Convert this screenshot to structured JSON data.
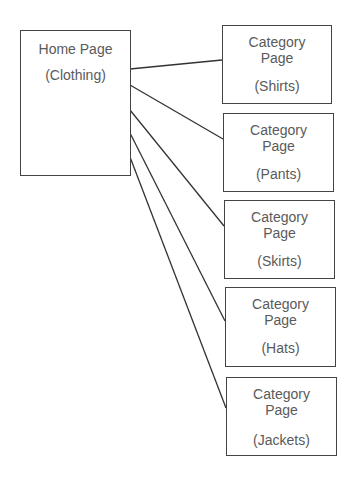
{
  "diagram": {
    "type": "site-hierarchy",
    "root": {
      "title": "Home Page",
      "subtitle": "(Clothing)"
    },
    "children": [
      {
        "title_line1": "Category",
        "title_line2": "Page",
        "subtitle": "(Shirts)"
      },
      {
        "title_line1": "Category",
        "title_line2": "Page",
        "subtitle": "(Pants)"
      },
      {
        "title_line1": "Category",
        "title_line2": "Page",
        "subtitle": "(Skirts)"
      },
      {
        "title_line1": "Category",
        "title_line2": "Page",
        "subtitle": "(Hats)"
      },
      {
        "title_line1": "Category",
        "title_line2": "Page",
        "subtitle": "(Jackets)"
      }
    ],
    "colors": {
      "border": "#444444",
      "text": "#5a5a5a",
      "line": "#333333"
    }
  }
}
